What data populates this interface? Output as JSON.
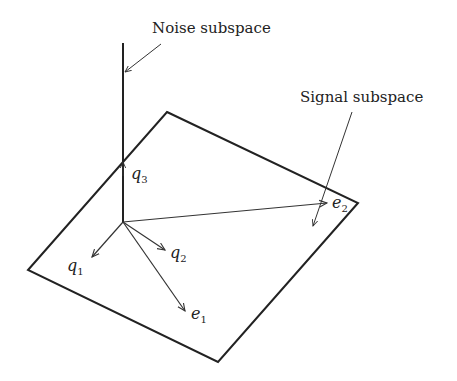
{
  "diagram": {
    "labels": {
      "noise_subspace": "Noise subspace",
      "signal_subspace": "Signal subspace"
    },
    "vectors": {
      "q1": {
        "base": "q",
        "sub": "1"
      },
      "q2": {
        "base": "q",
        "sub": "2"
      },
      "q3": {
        "base": "q",
        "sub": "3"
      },
      "e1": {
        "base": "e",
        "sub": "1"
      },
      "e2": {
        "base": "e",
        "sub": "2"
      }
    },
    "colors": {
      "stroke": "#222222",
      "background": "#ffffff"
    }
  }
}
